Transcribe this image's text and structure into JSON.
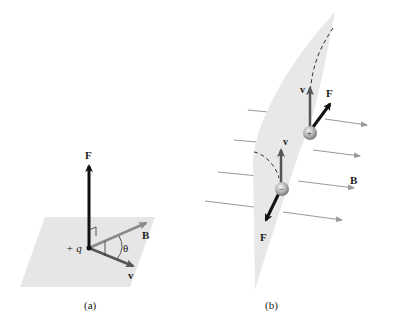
{
  "figure": {
    "panel_a": {
      "caption": "(a)",
      "labels": {
        "force": "F",
        "field": "B",
        "velocity": "v",
        "charge": "+ q",
        "angle": "θ"
      }
    },
    "panel_b": {
      "caption": "(b)",
      "labels": {
        "positive_velocity": "v",
        "positive_force": "F",
        "negative_velocity": "v",
        "negative_force": "F",
        "field": "B",
        "positive_sign": "+",
        "negative_sign": "−"
      }
    }
  },
  "colors": {
    "plane": "#e8e8e8",
    "force_arrow": "#111111",
    "field_arrow": "#8a8a8a",
    "velocity_arrow": "#555555",
    "field_lines": "#9a9a9a"
  }
}
